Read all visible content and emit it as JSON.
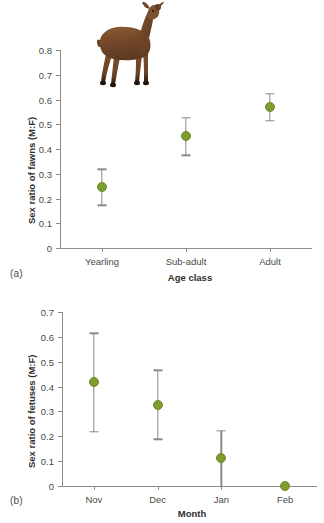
{
  "figure": {
    "panel_a_tag": "(a)",
    "panel_b_tag": "(b)",
    "marker_color": "#7d9c32",
    "errorbar_color": "#8a8a84",
    "axis_color": "#8d8d88",
    "photo_alt": "deer-photograph"
  },
  "chart_data": [
    {
      "type": "scatter",
      "panel": "(a)",
      "title": "",
      "xlabel": "Age class",
      "ylabel": "Sex ratio of fawns (M:F)",
      "categories": [
        "Yearling",
        "Sub-adult",
        "Adult"
      ],
      "values": [
        0.247,
        0.452,
        0.568
      ],
      "err_low": [
        0.172,
        0.375,
        0.515
      ],
      "err_high": [
        0.318,
        0.527,
        0.622
      ],
      "ylim": [
        0,
        0.8
      ],
      "yticks": [
        0,
        0.1,
        0.2,
        0.3,
        0.4,
        0.5,
        0.6,
        0.7,
        0.8
      ],
      "ytick_labels": [
        "0",
        "0.1",
        "0.2",
        "0.3",
        "0.4",
        "0.5",
        "0.6",
        "0.7",
        "0.8"
      ],
      "grid": false,
      "legend": "none",
      "errorbars": true
    },
    {
      "type": "scatter",
      "panel": "(b)",
      "title": "",
      "xlabel": "Month",
      "ylabel": "Sex ratio of fetuses (M:F)",
      "categories": [
        "Nov",
        "Dec",
        "Jan",
        "Feb"
      ],
      "values": [
        0.418,
        0.326,
        0.111,
        0.0
      ],
      "err_low": [
        0.219,
        0.188,
        0.0,
        0.0
      ],
      "err_high": [
        0.614,
        0.466,
        0.222,
        0.0
      ],
      "ylim": [
        0,
        0.7
      ],
      "yticks": [
        0,
        0.1,
        0.2,
        0.3,
        0.4,
        0.5,
        0.6,
        0.7
      ],
      "ytick_labels": [
        "0",
        "0.1",
        "0.2",
        "0.3",
        "0.4",
        "0.5",
        "0.6",
        "0.7"
      ],
      "grid": false,
      "legend": "none",
      "errorbars": true
    }
  ]
}
